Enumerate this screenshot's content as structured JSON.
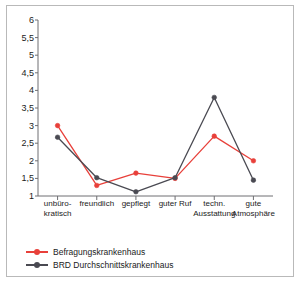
{
  "chart_data": {
    "type": "line",
    "title": "",
    "xlabel": "",
    "ylabel": "",
    "categories": [
      "unbüro-\nkratisch",
      "freundlich",
      "gepflegt",
      "guter Ruf",
      "techn.\nAusstattung",
      "gute\nAtmosphäre"
    ],
    "category_lines": [
      [
        "unbüro-",
        "kratisch"
      ],
      [
        "freundlich",
        ""
      ],
      [
        "gepflegt",
        ""
      ],
      [
        "guter Ruf",
        ""
      ],
      [
        "techn.",
        "Ausstattung"
      ],
      [
        "gute",
        "Atmosphäre"
      ]
    ],
    "series": [
      {
        "name": "Befragungskrankenhaus",
        "color": "#e8403a",
        "values": [
          3.0,
          1.3,
          1.65,
          1.5,
          2.7,
          2.0
        ]
      },
      {
        "name": "BRD Durchschnittskrankenhaus",
        "color": "#4a4a52",
        "values": [
          2.67,
          1.52,
          1.12,
          1.52,
          3.8,
          1.45
        ]
      }
    ],
    "ylim": [
      1,
      6
    ],
    "ytick_step": 0.5,
    "ytick_labels": [
      "6",
      "5,5",
      "5",
      "4,5",
      "4",
      "3,5",
      "3",
      "2,5",
      "2",
      "1,5",
      "1"
    ],
    "ytick_values": [
      6,
      5.5,
      5,
      4.5,
      4,
      3.5,
      3,
      2.5,
      2,
      1.5,
      1
    ],
    "grid": false,
    "legend_position": "bottom-left"
  },
  "legend": {
    "entries": [
      {
        "label": "Befragungskrankenhaus",
        "color": "#e8403a"
      },
      {
        "label": "BRD Durchschnittskrankenhaus",
        "color": "#4a4a52"
      }
    ]
  },
  "colors": {
    "axis": "#6e6e72",
    "frame": "#b9b9b9",
    "text": "#1b1b1b",
    "background": "#ffffff"
  }
}
